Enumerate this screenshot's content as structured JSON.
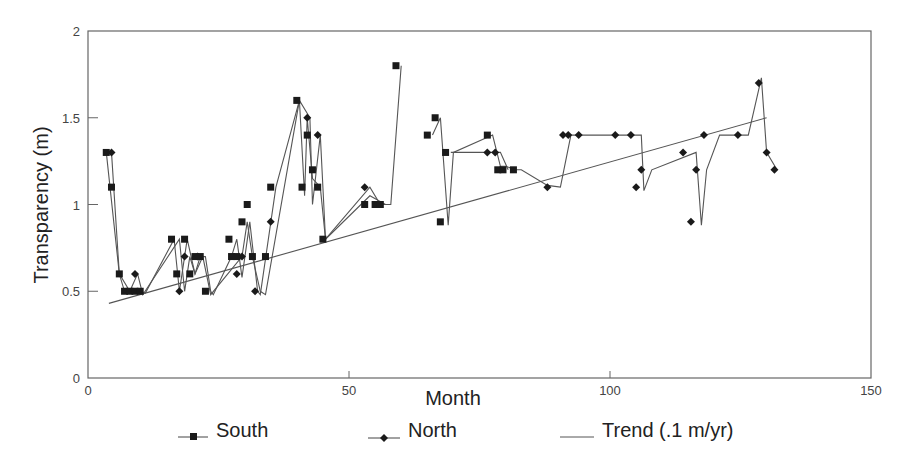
{
  "chart_data": {
    "type": "line",
    "title": "",
    "xlabel": "Month",
    "ylabel": "Transparency (m)",
    "xlim": [
      0,
      150
    ],
    "ylim": [
      0,
      2
    ],
    "xticks": [
      0,
      50,
      100,
      150
    ],
    "xtick_labels": [
      "0",
      "50",
      "100",
      "150"
    ],
    "yticks": [
      0,
      0.5,
      1,
      1.5,
      2
    ],
    "ytick_labels": [
      "0",
      "0.5",
      "1",
      "1.5",
      "2"
    ],
    "grid": false,
    "legend_position": "bottom",
    "series": [
      {
        "name": "South",
        "marker": "square",
        "points": [
          [
            3.5,
            1.3
          ],
          [
            4.5,
            1.1
          ],
          [
            6,
            0.6
          ],
          [
            7,
            0.5
          ],
          [
            8,
            0.5
          ],
          [
            9,
            0.5
          ],
          [
            10,
            0.5
          ],
          [
            16,
            0.8
          ],
          [
            17,
            0.6
          ],
          [
            18.5,
            0.8
          ],
          [
            19.5,
            0.6
          ],
          [
            20.5,
            0.7
          ],
          [
            21.5,
            0.7
          ],
          [
            22.5,
            0.5
          ],
          [
            27,
            0.8
          ],
          [
            27.5,
            0.7
          ],
          [
            28.5,
            0.7
          ],
          [
            29.5,
            0.9
          ],
          [
            30.5,
            1.0
          ],
          [
            31.5,
            0.7
          ],
          [
            34,
            0.7
          ],
          [
            35,
            1.1
          ],
          [
            40,
            1.6
          ],
          [
            41,
            1.1
          ],
          [
            42,
            1.4
          ],
          [
            43,
            1.2
          ],
          [
            44,
            1.1
          ],
          [
            45,
            0.8
          ],
          [
            53,
            1.0
          ],
          [
            55,
            1.0
          ],
          [
            56,
            1.0
          ],
          [
            59,
            1.8
          ],
          [
            65,
            1.4
          ],
          [
            66.5,
            1.5
          ],
          [
            67.5,
            0.9
          ],
          [
            68.5,
            1.3
          ],
          [
            76.5,
            1.4
          ],
          [
            78.5,
            1.2
          ],
          [
            79.5,
            1.2
          ],
          [
            81.5,
            1.2
          ]
        ]
      },
      {
        "name": "North",
        "marker": "diamond",
        "points": [
          [
            4.5,
            1.3
          ],
          [
            9,
            0.6
          ],
          [
            17.5,
            0.5
          ],
          [
            18.5,
            0.7
          ],
          [
            21,
            0.7
          ],
          [
            28.5,
            0.6
          ],
          [
            29.5,
            0.7
          ],
          [
            32,
            0.5
          ],
          [
            35,
            0.9
          ],
          [
            42,
            1.5
          ],
          [
            44,
            1.4
          ],
          [
            53,
            1.1
          ],
          [
            76.5,
            1.3
          ],
          [
            78,
            1.3
          ],
          [
            88,
            1.1
          ],
          [
            91,
            1.4
          ],
          [
            92,
            1.4
          ],
          [
            94,
            1.4
          ],
          [
            101,
            1.4
          ],
          [
            104,
            1.4
          ],
          [
            105,
            1.1
          ],
          [
            106,
            1.2
          ],
          [
            114,
            1.3
          ],
          [
            115.5,
            0.9
          ],
          [
            116.5,
            1.2
          ],
          [
            118,
            1.4
          ],
          [
            124.5,
            1.4
          ],
          [
            128.5,
            1.7
          ],
          [
            130,
            1.3
          ],
          [
            131.5,
            1.2
          ]
        ]
      },
      {
        "name": "Trend (.1 m/yr)",
        "marker": "none",
        "line": [
          [
            4,
            0.43
          ],
          [
            130,
            1.5
          ]
        ],
        "comment_free_mean_line": [
          [
            3.5,
            1.3
          ],
          [
            4.5,
            1.3
          ],
          [
            7,
            0.5
          ],
          [
            10,
            0.5
          ],
          [
            11,
            0.48
          ],
          [
            18,
            0.8
          ],
          [
            18.5,
            0.5
          ],
          [
            19.5,
            0.8
          ],
          [
            21,
            0.7
          ],
          [
            22.5,
            0.5
          ],
          [
            23.5,
            0.48
          ],
          [
            29,
            0.8
          ],
          [
            30,
            0.6
          ],
          [
            31,
            0.9
          ],
          [
            32,
            0.9
          ],
          [
            34,
            0.5
          ],
          [
            34.5,
            0.48
          ],
          [
            40.5,
            1.6
          ],
          [
            41.5,
            1.0
          ],
          [
            42,
            1.5
          ],
          [
            42.5,
            1.0
          ],
          [
            43.5,
            1.4
          ],
          [
            45,
            1.0
          ],
          [
            46,
            0.8
          ],
          [
            54,
            1.05
          ],
          [
            56,
            1.0
          ],
          [
            59.5,
            1.8
          ]
        ]
      }
    ],
    "connector_paths": [
      [
        [
          3.5,
          1.3
        ],
        [
          6,
          0.6
        ],
        [
          7,
          0.5
        ],
        [
          10,
          0.5
        ],
        [
          11,
          0.49
        ],
        [
          16.5,
          0.8
        ],
        [
          17.5,
          0.5
        ],
        [
          19,
          0.8
        ],
        [
          20.5,
          0.6
        ],
        [
          21.5,
          0.7
        ],
        [
          22.5,
          0.7
        ],
        [
          23.5,
          0.5
        ],
        [
          24,
          0.48
        ],
        [
          27.5,
          0.7
        ],
        [
          28.5,
          0.8
        ],
        [
          29.5,
          0.58
        ],
        [
          31,
          0.9
        ],
        [
          32.5,
          0.5
        ],
        [
          33,
          0.48
        ],
        [
          36,
          1.1
        ],
        [
          40.5,
          1.6
        ],
        [
          41.5,
          1.05
        ],
        [
          42,
          1.5
        ],
        [
          43,
          1.15
        ],
        [
          44.5,
          1.1
        ],
        [
          45.5,
          0.8
        ],
        [
          54,
          1.05
        ],
        [
          57,
          1.0
        ],
        [
          58,
          1.0
        ],
        [
          60,
          1.8
        ]
      ],
      [
        [
          4.5,
          1.3
        ],
        [
          6,
          0.6
        ],
        [
          8,
          0.5
        ],
        [
          9.5,
          0.6
        ],
        [
          10.5,
          0.48
        ],
        [
          17.5,
          0.8
        ],
        [
          18.5,
          0.5
        ],
        [
          19.5,
          0.7
        ],
        [
          20.5,
          0.6
        ],
        [
          22,
          0.7
        ],
        [
          23.5,
          0.48
        ],
        [
          29.5,
          0.7
        ],
        [
          30.5,
          0.9
        ],
        [
          31.5,
          0.7
        ],
        [
          33,
          0.5
        ],
        [
          34,
          0.48
        ],
        [
          40.5,
          1.6
        ],
        [
          42.5,
          1.5
        ],
        [
          43,
          1.0
        ],
        [
          44.5,
          1.4
        ],
        [
          45.5,
          0.8
        ],
        [
          54,
          1.1
        ],
        [
          56,
          1.0
        ],
        [
          57,
          1.0
        ]
      ],
      [
        [
          66,
          1.4
        ],
        [
          67.5,
          1.5
        ],
        [
          69,
          0.88
        ],
        [
          70,
          1.3
        ],
        [
          77.5,
          1.4
        ],
        [
          79,
          1.22
        ],
        [
          80,
          1.22
        ],
        [
          82,
          1.2
        ],
        [
          83,
          1.2
        ],
        [
          88,
          1.11
        ],
        [
          90.5,
          1.1
        ],
        [
          92.5,
          1.4
        ],
        [
          103,
          1.4
        ],
        [
          106,
          1.4
        ],
        [
          106.5,
          1.08
        ],
        [
          108,
          1.2
        ],
        [
          116.5,
          1.3
        ],
        [
          117.5,
          0.88
        ],
        [
          118.5,
          1.2
        ],
        [
          121,
          1.4
        ],
        [
          126.5,
          1.4
        ],
        [
          129,
          1.73
        ],
        [
          130,
          1.3
        ],
        [
          132,
          1.2
        ]
      ],
      [
        [
          69.5,
          1.3
        ],
        [
          79,
          1.3
        ],
        [
          80.5,
          1.2
        ]
      ]
    ]
  },
  "legend": {
    "items": [
      {
        "label": "South",
        "marker": "square"
      },
      {
        "label": "North",
        "marker": "diamond"
      },
      {
        "label": "Trend (.1 m/yr)",
        "marker": "none"
      }
    ]
  },
  "colors": {
    "line": "#555555",
    "marker": "#1a1a1a",
    "axis": "#666666",
    "text": "#222222"
  }
}
